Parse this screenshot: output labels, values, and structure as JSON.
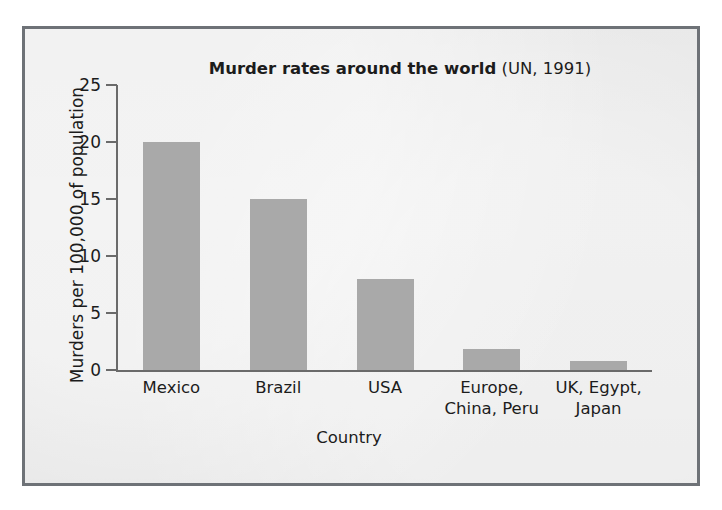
{
  "figure": {
    "panel_bg": "#e9e9e9",
    "panel_border": "#6e7277",
    "axis_color": "#6a6a6a",
    "bar_color": "#a9a9a9",
    "text_color": "#1c1c1c"
  },
  "chart_data": {
    "type": "bar",
    "title": "Murder rates around the world (UN, 1991)",
    "title_bold_part": "Murder rates around the world",
    "title_regular_part": "(UN, 1991)",
    "xlabel": "Country",
    "ylabel": "Murders per 100,000 of population",
    "categories": [
      "Mexico",
      "Brazil",
      "USA",
      "Europe,\nChina, Peru",
      "UK, Egypt,\nJapan"
    ],
    "values": [
      20,
      15,
      8,
      1.8,
      0.8
    ],
    "ylim": [
      0,
      25
    ],
    "yticks": [
      0,
      5,
      10,
      15,
      20,
      25
    ],
    "ytick_labels": [
      "0",
      "5",
      "10",
      "15",
      "20",
      "25"
    ],
    "grid": false,
    "legend": false
  }
}
